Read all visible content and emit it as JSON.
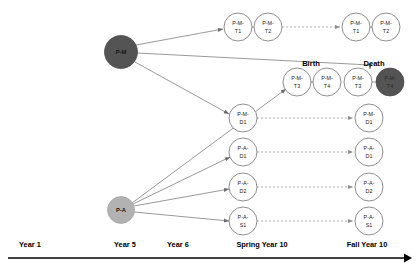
{
  "diagram": {
    "colors": {
      "node_fill": "#ffffff",
      "node_stroke": "#5f5f5f",
      "hub_mother": "#545454",
      "hub_adult": "#b2b2b2",
      "dead_node": "#545454",
      "edge_solid": "#6d6d6d",
      "edge_dashed": "#8f8f8f",
      "axis": "#000000",
      "text": "#000000"
    },
    "hubs": [
      {
        "id": "hub-pm",
        "label": "P-M",
        "x": 121,
        "y": 52,
        "r": 16.5,
        "style": "dark"
      },
      {
        "id": "hub-pa",
        "label": "P-A",
        "x": 121,
        "y": 210,
        "r": 13.5,
        "style": "light"
      }
    ],
    "nodes": [
      {
        "id": "spring-pm-t1",
        "line1": "P-M-",
        "line2": "T1",
        "x": 238,
        "y": 27,
        "r": 14,
        "style": "open",
        "column": "spring"
      },
      {
        "id": "spring-pm-t2",
        "line1": "P-M-",
        "line2": "T2",
        "x": 268,
        "y": 27,
        "r": 14,
        "style": "open",
        "column": "spring"
      },
      {
        "id": "fall-pm-t1",
        "line1": "P-M-",
        "line2": "T1",
        "x": 356,
        "y": 27,
        "r": 14,
        "style": "open",
        "column": "fall"
      },
      {
        "id": "fall-pm-t2",
        "line1": "P-M-",
        "line2": "T2",
        "x": 386,
        "y": 27,
        "r": 14,
        "style": "open",
        "column": "fall"
      },
      {
        "id": "spring-pm-t3",
        "line1": "P-M-",
        "line2": "T3",
        "x": 297,
        "y": 82,
        "r": 14,
        "style": "open",
        "column": "spring"
      },
      {
        "id": "spring-pm-t4",
        "line1": "P-M-",
        "line2": "T4",
        "x": 327,
        "y": 82,
        "r": 14,
        "style": "open",
        "column": "spring"
      },
      {
        "id": "fall-pm-t3",
        "line1": "P-M-",
        "line2": "T3",
        "x": 358,
        "y": 82,
        "r": 14,
        "style": "open",
        "column": "fall"
      },
      {
        "id": "fall-pm-t4",
        "line1": "P-M-",
        "line2": "T4",
        "x": 390,
        "y": 82,
        "r": 14,
        "style": "dark",
        "column": "fall"
      },
      {
        "id": "spring-pm-d1",
        "line1": "P-M-",
        "line2": "D1",
        "x": 243,
        "y": 118,
        "r": 14,
        "style": "open",
        "column": "spring"
      },
      {
        "id": "fall-pm-d1",
        "line1": "P-M-",
        "line2": "D1",
        "x": 369,
        "y": 118,
        "r": 14,
        "style": "open",
        "column": "fall"
      },
      {
        "id": "spring-pa-d1",
        "line1": "P-A-",
        "line2": "D1",
        "x": 243,
        "y": 152,
        "r": 14,
        "style": "open",
        "column": "spring"
      },
      {
        "id": "fall-pa-d1",
        "line1": "P-A-",
        "line2": "D1",
        "x": 369,
        "y": 152,
        "r": 14,
        "style": "open",
        "column": "fall"
      },
      {
        "id": "spring-pa-d2",
        "line1": "P-A-",
        "line2": "D2",
        "x": 243,
        "y": 187,
        "r": 14,
        "style": "open",
        "column": "spring"
      },
      {
        "id": "fall-pa-d2",
        "line1": "P-A-",
        "line2": "D2",
        "x": 369,
        "y": 187,
        "r": 14,
        "style": "open",
        "column": "fall"
      },
      {
        "id": "spring-pa-s1",
        "line1": "P-A-",
        "line2": "S1",
        "x": 243,
        "y": 221,
        "r": 14,
        "style": "open",
        "column": "spring"
      },
      {
        "id": "fall-pa-s1",
        "line1": "P-A-",
        "line2": "S1",
        "x": 369,
        "y": 221,
        "r": 14,
        "style": "open",
        "column": "fall"
      }
    ],
    "annotations": [
      {
        "id": "birth-label",
        "text": "Birth",
        "x": 311,
        "y": 66
      },
      {
        "id": "death-label",
        "text": "Death",
        "x": 374,
        "y": 66
      }
    ],
    "timeline": {
      "labels": [
        {
          "id": "year-1",
          "text": "Year 1",
          "x": 30,
          "y": 247
        },
        {
          "id": "year-5",
          "text": "Year 5",
          "x": 125,
          "y": 247
        },
        {
          "id": "year-6",
          "text": "Year 6",
          "x": 178,
          "y": 247
        },
        {
          "id": "spring-year-10",
          "text": "Spring Year 10",
          "x": 262,
          "y": 247
        },
        {
          "id": "fall-year-10",
          "text": "Fall Year 10",
          "x": 367,
          "y": 247
        }
      ],
      "axis": {
        "x1": 8,
        "y1": 258,
        "x2": 410,
        "y2": 258
      }
    },
    "edges": [
      {
        "id": "pm-to-t1",
        "kind": "solid-arrow",
        "from": "hub-pm",
        "to": "spring-pm-t1"
      },
      {
        "id": "pm-to-death",
        "kind": "solid-arrow",
        "from": "hub-pm",
        "to": "fall-pm-t3"
      },
      {
        "id": "pm-to-d1",
        "kind": "solid-arrow",
        "from": "hub-pm",
        "to": "spring-pm-d1"
      },
      {
        "id": "pa-to-birth",
        "kind": "solid-arrow",
        "from": "hub-pa",
        "to": "spring-pm-t3"
      },
      {
        "id": "pa-to-pad1",
        "kind": "solid-arrow",
        "from": "hub-pa",
        "to": "spring-pa-d1"
      },
      {
        "id": "pa-to-pad2",
        "kind": "solid-arrow",
        "from": "hub-pa",
        "to": "spring-pa-d2"
      },
      {
        "id": "pa-to-pas1",
        "kind": "solid-arrow",
        "from": "hub-pa",
        "to": "spring-pa-s1"
      },
      {
        "id": "spring-t1-t2",
        "kind": "link",
        "from": "spring-pm-t1",
        "to": "spring-pm-t2"
      },
      {
        "id": "fall-t1-t2",
        "kind": "link",
        "from": "fall-pm-t1",
        "to": "fall-pm-t2"
      },
      {
        "id": "spring-t3-t4",
        "kind": "link",
        "from": "spring-pm-t3",
        "to": "spring-pm-t4"
      },
      {
        "id": "fall-t3-t4",
        "kind": "link",
        "from": "fall-pm-t3",
        "to": "fall-pm-t4"
      },
      {
        "id": "t2-to-fall-t1",
        "kind": "dashed-arrow",
        "from": "spring-pm-t2",
        "to": "fall-pm-t1"
      },
      {
        "id": "pmd1-to-fall",
        "kind": "dashed-arrow",
        "from": "spring-pm-d1",
        "to": "fall-pm-d1"
      },
      {
        "id": "pad1-to-fall",
        "kind": "dashed-arrow",
        "from": "spring-pa-d1",
        "to": "fall-pa-d1"
      },
      {
        "id": "pad2-to-fall",
        "kind": "dashed-arrow",
        "from": "spring-pa-d2",
        "to": "fall-pa-d2"
      },
      {
        "id": "pas1-to-fall",
        "kind": "dashed-arrow",
        "from": "spring-pa-s1",
        "to": "fall-pa-s1"
      }
    ]
  }
}
